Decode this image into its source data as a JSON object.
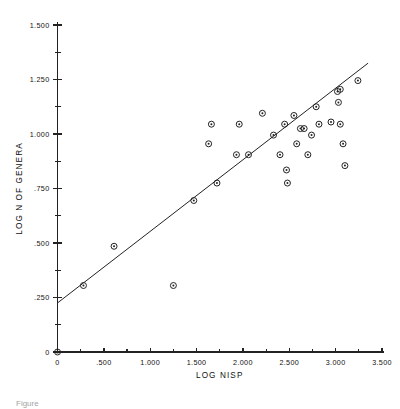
{
  "figure": {
    "background_color": "#ffffff",
    "ink_color": "#222222",
    "caption_partial": "Figure"
  },
  "chart_data": {
    "type": "scatter",
    "title": "",
    "xlabel": "LOG NISP",
    "ylabel": "LOG N OF GENERA",
    "xlim": [
      0,
      3.5
    ],
    "ylim": [
      0,
      1.5
    ],
    "grid": false,
    "legend": false,
    "marker": "circle-with-center-dot",
    "x_ticks": [
      0,
      0.5,
      1.0,
      1.5,
      2.0,
      2.5,
      3.0,
      3.5
    ],
    "x_tick_labels": [
      "0",
      ".500",
      "1.000",
      "1.500",
      "2.000",
      "2.500",
      "3.000",
      "3.500"
    ],
    "x_minor_ticks": [
      0.25,
      0.75,
      1.25,
      1.75,
      2.25,
      2.75,
      3.25
    ],
    "y_ticks": [
      0,
      0.25,
      0.5,
      0.75,
      1.0,
      1.25,
      1.5
    ],
    "y_tick_labels": [
      "0",
      ".250",
      ".500",
      ".750",
      "1.000",
      "1.250",
      "1.500"
    ],
    "y_minor_ticks": [
      0.125,
      0.375,
      0.625,
      0.875,
      1.125,
      1.375
    ],
    "fit_line": {
      "x_start": 0.0,
      "y_start": 0.225,
      "x_end": 3.35,
      "y_end": 1.325,
      "slope": 0.328,
      "intercept": 0.225
    },
    "points": [
      {
        "x": 0.28,
        "y": 0.305
      },
      {
        "x": 0.61,
        "y": 0.485
      },
      {
        "x": 1.25,
        "y": 0.305
      },
      {
        "x": 1.47,
        "y": 0.695
      },
      {
        "x": 1.63,
        "y": 0.955
      },
      {
        "x": 1.66,
        "y": 1.045
      },
      {
        "x": 1.72,
        "y": 0.775
      },
      {
        "x": 1.93,
        "y": 0.905
      },
      {
        "x": 1.96,
        "y": 1.045
      },
      {
        "x": 2.06,
        "y": 0.905
      },
      {
        "x": 2.21,
        "y": 1.095
      },
      {
        "x": 2.33,
        "y": 0.995
      },
      {
        "x": 2.4,
        "y": 0.905
      },
      {
        "x": 2.45,
        "y": 1.045
      },
      {
        "x": 2.47,
        "y": 0.835
      },
      {
        "x": 2.48,
        "y": 0.775
      },
      {
        "x": 2.55,
        "y": 1.085
      },
      {
        "x": 2.58,
        "y": 0.955
      },
      {
        "x": 2.62,
        "y": 1.025
      },
      {
        "x": 2.66,
        "y": 1.025
      },
      {
        "x": 2.7,
        "y": 0.905
      },
      {
        "x": 2.74,
        "y": 0.995
      },
      {
        "x": 2.79,
        "y": 1.125
      },
      {
        "x": 2.82,
        "y": 1.045
      },
      {
        "x": 2.95,
        "y": 1.055
      },
      {
        "x": 3.02,
        "y": 1.195
      },
      {
        "x": 3.03,
        "y": 1.145
      },
      {
        "x": 3.05,
        "y": 1.045
      },
      {
        "x": 3.08,
        "y": 0.955
      },
      {
        "x": 3.1,
        "y": 0.855
      },
      {
        "x": 3.24,
        "y": 1.245
      },
      {
        "x": 3.05,
        "y": 1.205
      }
    ]
  }
}
